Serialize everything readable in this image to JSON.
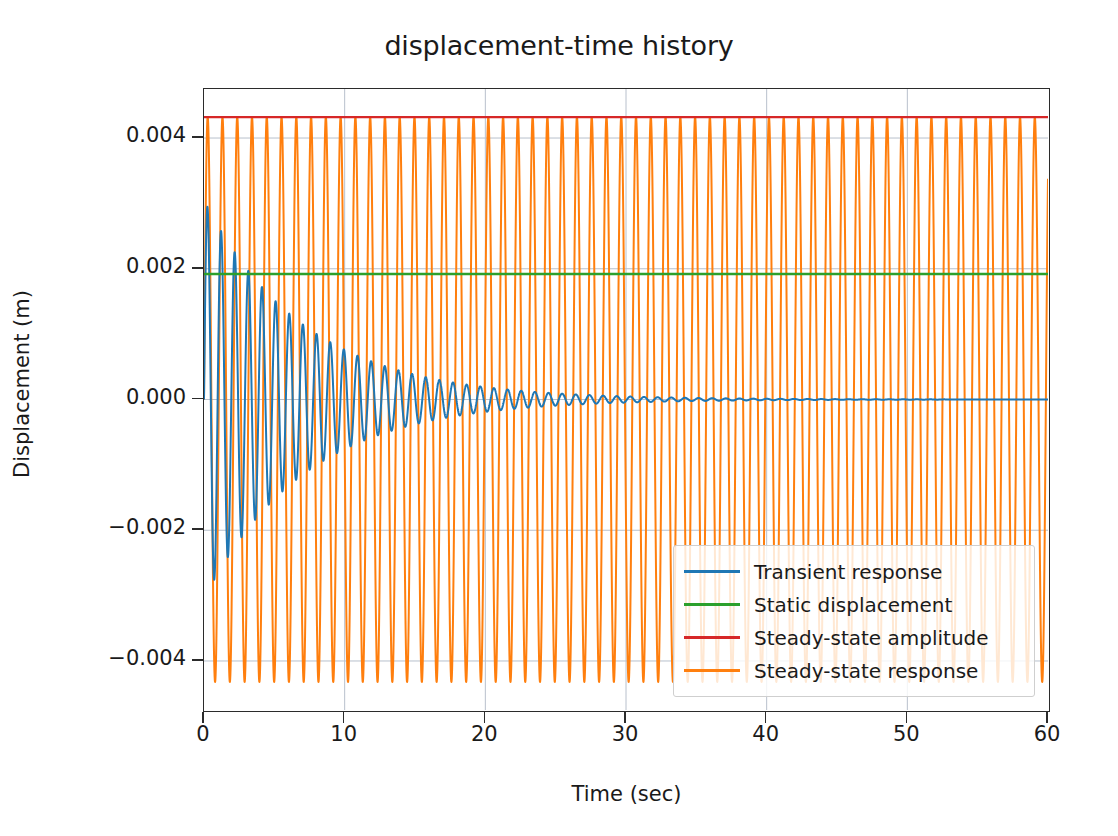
{
  "chart_data": {
    "type": "line",
    "title": "displacement-time history",
    "xlabel": "Time (sec)",
    "ylabel": "Displacement (m)",
    "xlim": [
      0,
      60
    ],
    "ylim": [
      -0.00475,
      0.00475
    ],
    "xticks": [
      0,
      10,
      20,
      30,
      40,
      50,
      60
    ],
    "xtick_labels": [
      "0",
      "10",
      "20",
      "30",
      "40",
      "50",
      "60"
    ],
    "yticks": [
      -0.004,
      -0.002,
      0.0,
      0.002,
      0.004
    ],
    "ytick_labels": [
      "−0.004",
      "−0.002",
      "0.000",
      "0.002",
      "0.004"
    ],
    "grid": true,
    "legend_position": "lower right",
    "series": [
      {
        "name": "Transient response",
        "color": "#1f77b4",
        "kind": "damped-oscillation",
        "amplitude": 0.00305,
        "period": 0.97,
        "phase": 0.0,
        "decay_time_constant": 7.2,
        "description": "Exponentially decaying oscillation starting near ±0.003 and settling to 0 by about t = 35 s"
      },
      {
        "name": "Static displacement",
        "color": "#2ca02c",
        "kind": "horizontal-line",
        "value": 0.00192
      },
      {
        "name": "Steady-state amplitude",
        "color": "#d62728",
        "kind": "horizontal-line",
        "value": 0.00432
      },
      {
        "name": "Steady-state response",
        "color": "#ff7f0e",
        "kind": "oscillation",
        "amplitude": 0.00432,
        "period": 1.05,
        "phase": 0.0,
        "description": "Constant amplitude harmonic oscillation spanning ±0.00432 across the full 60 s window"
      }
    ]
  },
  "legend": {
    "entries": [
      {
        "label": "Transient response",
        "color": "#1f77b4"
      },
      {
        "label": "Static displacement",
        "color": "#2ca02c"
      },
      {
        "label": "Steady-state amplitude",
        "color": "#d62728"
      },
      {
        "label": "Steady-state response",
        "color": "#ff7f0e"
      }
    ]
  },
  "style": {
    "background": "#ffffff",
    "axis_color": "#2b2b2b",
    "grid_color": "#b8c0cc",
    "text_color": "#1a1a1a"
  }
}
